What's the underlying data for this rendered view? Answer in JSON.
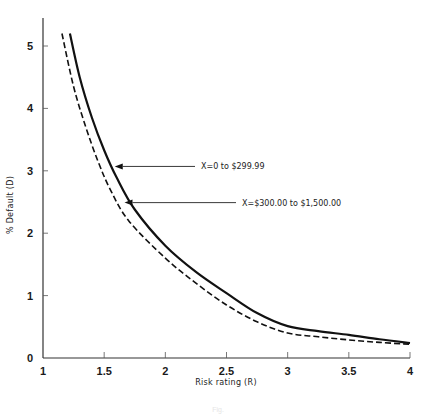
{
  "chart_data": {
    "type": "line",
    "title": "",
    "xlabel": "Risk rating (R)",
    "ylabel": "% Default (D)",
    "xlim": [
      1,
      4
    ],
    "ylim": [
      0,
      5.3
    ],
    "xticks": [
      1,
      1.5,
      2,
      2.5,
      3,
      3.5,
      4
    ],
    "xtick_labels": [
      "1",
      "1.5",
      "2",
      "2.5",
      "3",
      "3.5",
      "4"
    ],
    "yticks": [
      0,
      1,
      2,
      3,
      4,
      5
    ],
    "ytick_labels": [
      "0",
      "1",
      "2",
      "3",
      "4",
      "5"
    ],
    "grid": false,
    "legend": "none (curves labeled with arrow annotations)",
    "series": [
      {
        "name": "X=0 to $299.99",
        "style": "solid",
        "x": [
          1.22,
          1.3,
          1.4,
          1.5,
          1.6,
          1.75,
          2.0,
          2.25,
          2.5,
          2.75,
          3.0,
          3.25,
          3.5,
          3.75,
          4.0
        ],
        "y": [
          5.2,
          4.5,
          3.85,
          3.33,
          2.9,
          2.38,
          1.8,
          1.38,
          1.04,
          0.72,
          0.51,
          0.43,
          0.37,
          0.3,
          0.24
        ]
      },
      {
        "name": "X=$300.00 to $1,500.00",
        "style": "dashed",
        "x": [
          1.155,
          1.25,
          1.35,
          1.45,
          1.55,
          1.7,
          2.0,
          2.25,
          2.5,
          2.75,
          3.0,
          3.25,
          3.5,
          3.75,
          4.0
        ],
        "y": [
          5.2,
          4.35,
          3.7,
          3.15,
          2.7,
          2.2,
          1.6,
          1.2,
          0.85,
          0.58,
          0.4,
          0.34,
          0.29,
          0.25,
          0.22
        ]
      }
    ],
    "annotations": [
      {
        "text": "X=0 to $299.99",
        "target_series": 0,
        "arrow_to": [
          1.57,
          3.07
        ],
        "text_pos_px": [
          245,
          172
        ]
      },
      {
        "text": "X=$300.00 to $1,500.00",
        "target_series": 1,
        "arrow_to": [
          1.65,
          2.49
        ],
        "text_pos_px": [
          315,
          210
        ]
      }
    ],
    "caption": "Fig."
  }
}
